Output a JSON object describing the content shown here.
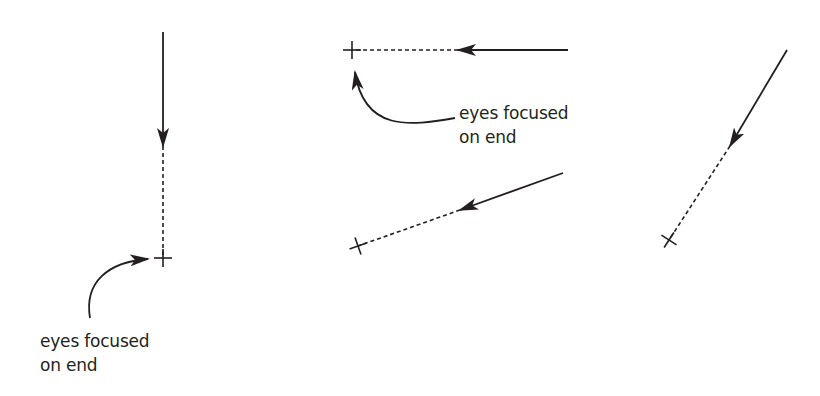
{
  "figure": {
    "stroke_color": "#231f20",
    "background": "#ffffff",
    "panels": [
      {
        "id": "vertical",
        "solid": {
          "x1": 163,
          "y1": 32,
          "x2": 163,
          "y2": 146
        },
        "dashed": {
          "x1": 163,
          "y1": 146,
          "x2": 163,
          "y2": 258
        },
        "end_marker": {
          "x": 163,
          "y": 258,
          "type": "cross"
        },
        "annotation": {
          "line1": "eyes focused",
          "line2": "on end",
          "x": 40,
          "y": 329,
          "pointer_path": "M 90 318 C 84 282, 108 262, 148 259"
        }
      },
      {
        "id": "horizontal",
        "solid": {
          "x1": 568,
          "y1": 50,
          "x2": 458,
          "y2": 50
        },
        "dashed": {
          "x1": 458,
          "y1": 50,
          "x2": 352,
          "y2": 50
        },
        "end_marker": {
          "x": 352,
          "y": 50,
          "type": "cross"
        },
        "annotation": {
          "line1": "eyes focused",
          "line2": "on end",
          "x": 459,
          "y": 101,
          "pointer_path": "M 455 118 C 410 126, 364 132, 355 72"
        }
      },
      {
        "id": "shallow-diagonal",
        "solid": {
          "x1": 563,
          "y1": 173,
          "x2": 460,
          "y2": 210
        },
        "dashed": {
          "x1": 460,
          "y1": 210,
          "x2": 358,
          "y2": 246
        },
        "end_marker": {
          "x": 358,
          "y": 246,
          "type": "cross"
        }
      },
      {
        "id": "steep-diagonal",
        "solid": {
          "x1": 787,
          "y1": 50,
          "x2": 730,
          "y2": 146
        },
        "dashed": {
          "x1": 730,
          "y1": 146,
          "x2": 669,
          "y2": 240
        },
        "end_marker": {
          "x": 669,
          "y": 240,
          "type": "cross"
        }
      }
    ]
  }
}
